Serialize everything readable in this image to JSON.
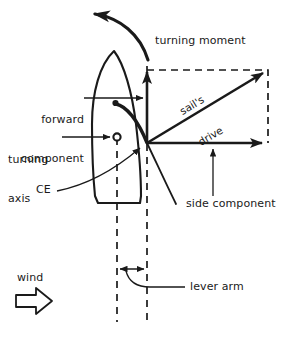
{
  "figure": {
    "stroke_color": "#1a1a1a",
    "background_color": "#ffffff"
  },
  "labels": {
    "turning_moment": "turning moment",
    "forward_component_line1": "forward",
    "forward_component_line2": "component",
    "turning_axis_line1": "turning",
    "turning_axis_line2": "axis",
    "ce": "CE",
    "sails_drive_line1": "sail's",
    "sails_drive_line2": "drive",
    "side_component": "side component",
    "wind": "wind",
    "lever_arm": "lever arm"
  },
  "icons": {
    "wind_arrow": "wind-block-arrow-right",
    "turning_moment_arrow": "curved-arrow-counterclockwise",
    "forward_component_arrow": "arrow-up",
    "side_component_arrow": "arrow-right",
    "sails_drive_arrow": "arrow-diagonal-up-right",
    "lever_arm_arrow": "double-headed-arrow-horizontal"
  },
  "geometry": {
    "origin_x": 147,
    "origin_y": 143,
    "turning_axis_x": 117,
    "turning_axis_y": 137,
    "mast_x": 115,
    "mast_y": 103,
    "vector_tip_x": 266,
    "vector_tip_y": 70,
    "forward_component_tip_y": 68,
    "side_component_tip_x": 266,
    "lever_arm_left_x": 117,
    "lever_arm_right_x": 147,
    "lever_arm_y": 270
  }
}
